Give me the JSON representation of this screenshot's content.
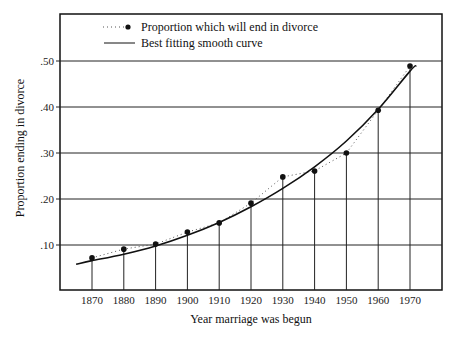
{
  "chart_data": {
    "type": "line",
    "title": "",
    "xlabel": "Year marriage was begun",
    "ylabel": "Proportion ending in divorce",
    "categories": [
      "1870",
      "1880",
      "1890",
      "1900",
      "1910",
      "1920",
      "1930",
      "1940",
      "1950",
      "1960",
      "1970"
    ],
    "series": [
      {
        "name": "Proportion which will end in divorce",
        "style": "dotted line with dot markers and vertical drop lines",
        "values": [
          0.072,
          0.091,
          0.102,
          0.128,
          0.148,
          0.191,
          0.248,
          0.261,
          0.3,
          0.393,
          0.489
        ]
      },
      {
        "name": "Best fitting smooth curve",
        "style": "solid curve",
        "approx_points": [
          [
            1865,
            0.058
          ],
          [
            1870,
            0.066
          ],
          [
            1880,
            0.08
          ],
          [
            1890,
            0.098
          ],
          [
            1900,
            0.121
          ],
          [
            1910,
            0.149
          ],
          [
            1920,
            0.183
          ],
          [
            1930,
            0.223
          ],
          [
            1940,
            0.27
          ],
          [
            1950,
            0.326
          ],
          [
            1960,
            0.395
          ],
          [
            1970,
            0.478
          ],
          [
            1972,
            0.49
          ]
        ]
      }
    ],
    "yticks": [
      ".10",
      ".20",
      ".30",
      ".40",
      ".50"
    ],
    "ytick_values": [
      0.1,
      0.2,
      0.3,
      0.4,
      0.5
    ],
    "ylim": [
      0,
      0.6
    ],
    "xlim": [
      1860,
      1980
    ],
    "grid": "horizontal gridlines at each y tick",
    "legend_position": "top-left inside plot"
  },
  "legend": {
    "item1": "Proportion which will end in divorce",
    "item2": "Best fitting smooth curve"
  },
  "axes": {
    "xlabel": "Year marriage was begun",
    "ylabel": "Proportion ending in divorce",
    "yticks": [
      ".10",
      ".20",
      ".30",
      ".40",
      ".50"
    ],
    "xticks": [
      "1870",
      "1880",
      "1890",
      "1900",
      "1910",
      "1920",
      "1930",
      "1940",
      "1950",
      "1960",
      "1970"
    ]
  }
}
